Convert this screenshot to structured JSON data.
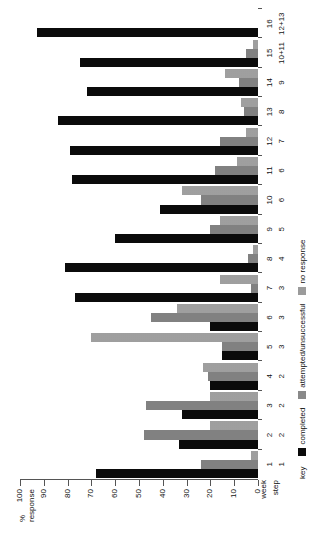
{
  "chart_data": {
    "type": "bar",
    "orientation": "horizontal",
    "title": "",
    "xlabel": "",
    "ylabel": "% response",
    "ylim": [
      0,
      100
    ],
    "grid": false,
    "legend_position": "bottom-left",
    "axis_ticks": [
      "0",
      "10",
      "20",
      "30",
      "40",
      "50",
      "60",
      "70",
      "80",
      "90",
      "100"
    ],
    "category_axis_names": [
      "week",
      "step"
    ],
    "categories": [
      {
        "week": "1",
        "step": "1"
      },
      {
        "week": "2",
        "step": "2"
      },
      {
        "week": "3",
        "step": "2"
      },
      {
        "week": "4",
        "step": "2"
      },
      {
        "week": "5",
        "step": "3"
      },
      {
        "week": "6",
        "step": "3"
      },
      {
        "week": "7",
        "step": "3"
      },
      {
        "week": "8",
        "step": "4"
      },
      {
        "week": "9",
        "step": "5"
      },
      {
        "week": "10",
        "step": "6"
      },
      {
        "week": "11",
        "step": "6"
      },
      {
        "week": "12",
        "step": "7"
      },
      {
        "week": "13",
        "step": "8"
      },
      {
        "week": "14",
        "step": "9"
      },
      {
        "week": "15",
        "step": "10+11"
      },
      {
        "week": "16",
        "step": "12+13"
      }
    ],
    "series": [
      {
        "name": "completed",
        "color": "#0b0b0b",
        "values": [
          68,
          33,
          32,
          20,
          15,
          20,
          77,
          81,
          60,
          41,
          78,
          79,
          84,
          72,
          75,
          93
        ]
      },
      {
        "name": "attempted/unsuccessful",
        "color": "#4a4a4a",
        "values": [
          24,
          48,
          47,
          21,
          15,
          45,
          3,
          4,
          20,
          24,
          18,
          16,
          6,
          8,
          5,
          0
        ]
      },
      {
        "name": "no response",
        "color": "#cfcfcf",
        "values": [
          3,
          20,
          20,
          23,
          70,
          34,
          16,
          2,
          16,
          32,
          9,
          5,
          7,
          14,
          2,
          0
        ]
      }
    ]
  },
  "legend": {
    "title": "key",
    "entries": [
      {
        "label": "completed",
        "pattern": "solid-black"
      },
      {
        "label": "attempted/unsuccessful",
        "pattern": "dark-hatch"
      },
      {
        "label": "no response",
        "pattern": "light-hatch"
      }
    ]
  }
}
